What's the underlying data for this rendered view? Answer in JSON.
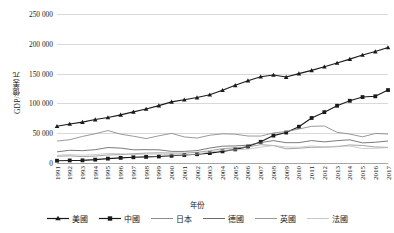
{
  "chart_data": {
    "type": "line",
    "title": "",
    "xlabel": "年份",
    "ylabel": "GDP/億美元",
    "grid": true,
    "legend_position": "bottom",
    "ylim": [
      0,
      250000
    ],
    "y_ticks": [
      "0",
      "50 000",
      "100 000",
      "150 000",
      "200 000",
      "250 000"
    ],
    "y_tick_values": [
      0,
      50000,
      100000,
      150000,
      200000,
      250000
    ],
    "categories": [
      "1991",
      "1992",
      "1993",
      "1994",
      "1995",
      "1996",
      "1997",
      "1998",
      "1999",
      "2000",
      "2001",
      "2002",
      "2003",
      "2004",
      "2005",
      "2006",
      "2007",
      "2008",
      "2009",
      "2010",
      "2011",
      "2012",
      "2013",
      "2014",
      "2015",
      "2016",
      "2017"
    ],
    "series": [
      {
        "name": "美國",
        "color": "#1a1a1a",
        "marker": "triangle",
        "values": [
          61740,
          65390,
          68590,
          72870,
          76400,
          80730,
          85770,
          90620,
          96310,
          102520,
          106210,
          109770,
          114560,
          122170,
          130360,
          138150,
          144780,
          147690,
          144190,
          149920,
          155420,
          161550,
          167849,
          174279,
          181206,
          186951,
          193906
        ]
      },
      {
        "name": "中國",
        "color": "#1a1a1a",
        "marker": "square",
        "values": [
          3832,
          4269,
          4447,
          5643,
          7345,
          8638,
          9616,
          10250,
          10941,
          12113,
          13394,
          14707,
          16602,
          19552,
          22860,
          27522,
          35520,
          45982,
          51100,
          60872,
          75515,
          85322,
          96074,
          104385,
          110616,
          111911,
          122377
        ]
      },
      {
        "name": "日本",
        "color": "#808080",
        "marker": "none",
        "values": [
          36790,
          39080,
          44550,
          49070,
          54490,
          48350,
          44920,
          40980,
          45620,
          49680,
          43740,
          41820,
          46600,
          48930,
          48310,
          45300,
          45150,
          50380,
          52890,
          57000,
          61570,
          62030,
          51560,
          48500,
          43890,
          49490,
          48720
        ]
      },
      {
        "name": "德國",
        "color": "#595959",
        "marker": "none",
        "values": [
          18670,
          21320,
          20710,
          22360,
          25940,
          25010,
          22170,
          22410,
          22090,
          19490,
          19420,
          20790,
          25050,
          28190,
          28610,
          29940,
          34280,
          37520,
          34090,
          34170,
          37570,
          35430,
          37520,
          38900,
          33750,
          34770,
          36930
        ]
      },
      {
        "name": "英國",
        "color": "#8c8c8c",
        "marker": "none",
        "values": [
          11380,
          11990,
          10630,
          11570,
          13440,
          14090,
          15600,
          16570,
          17050,
          16680,
          16540,
          17840,
          20530,
          24170,
          25380,
          26930,
          30740,
          29290,
          23820,
          24750,
          26300,
          26620,
          27390,
          30230,
          29360,
          26890,
          26220
        ]
      },
      {
        "name": "法國",
        "color": "#bfbfbf",
        "marker": "none",
        "values": [
          12730,
          14030,
          13150,
          14110,
          16090,
          15600,
          14080,
          14640,
          14930,
          13650,
          13790,
          14920,
          18430,
          21220,
          21960,
          23240,
          26600,
          29340,
          26950,
          26470,
          28650,
          26830,
          28110,
          28520,
          24380,
          24650,
          25830
        ]
      }
    ]
  },
  "axes": {
    "y_title": "GDP/億美元",
    "x_title": "年份"
  },
  "legend": {
    "items": [
      {
        "label": "美國",
        "marker": "triangle",
        "color": "#1a1a1a"
      },
      {
        "label": "中國",
        "marker": "square",
        "color": "#1a1a1a"
      },
      {
        "label": "日本",
        "marker": "none",
        "color": "#808080"
      },
      {
        "label": "德國",
        "marker": "none",
        "color": "#595959"
      },
      {
        "label": "英國",
        "marker": "none",
        "color": "#8c8c8c"
      },
      {
        "label": "法國",
        "marker": "none",
        "color": "#bfbfbf"
      }
    ]
  }
}
